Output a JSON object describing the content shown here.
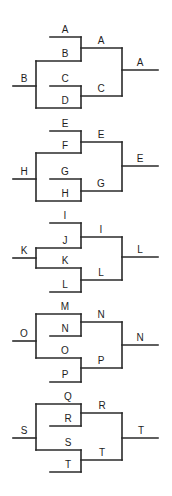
{
  "diagram": {
    "type": "tournament-brackets",
    "line_color": "#2a2a2a",
    "text_color": "#1e1e1e",
    "brackets": [
      {
        "id": "bracket-1",
        "entry_label": "B",
        "round1": [
          "A",
          "B",
          "C",
          "D"
        ],
        "round2": [
          "A",
          "C"
        ],
        "winner": "A"
      },
      {
        "id": "bracket-2",
        "entry_label": "H",
        "round1": [
          "E",
          "F",
          "G",
          "H"
        ],
        "round2": [
          "E",
          "G"
        ],
        "winner": "E"
      },
      {
        "id": "bracket-3",
        "entry_label": "K",
        "round1": [
          "I",
          "J",
          "K",
          "L"
        ],
        "round2": [
          "I",
          "L"
        ],
        "winner": "L"
      },
      {
        "id": "bracket-4",
        "entry_label": "O",
        "round1": [
          "M",
          "N",
          "O",
          "P"
        ],
        "round2": [
          "N",
          "P"
        ],
        "winner": "N"
      },
      {
        "id": "bracket-5",
        "entry_label": "S",
        "round1": [
          "Q",
          "R",
          "S",
          "T"
        ],
        "round2": [
          "R",
          "T"
        ],
        "winner": "T"
      }
    ]
  }
}
